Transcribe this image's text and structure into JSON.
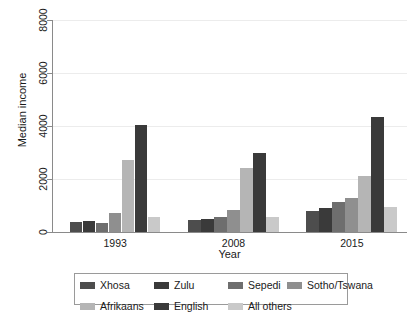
{
  "chart_data": {
    "type": "bar",
    "title": "",
    "xlabel": "Year",
    "ylabel": "Median income",
    "categories": [
      "1993",
      "2008",
      "2015"
    ],
    "ylim": [
      0,
      8000
    ],
    "yticks": [
      0,
      2000,
      4000,
      6000,
      8000
    ],
    "ytick_labels": [
      "0",
      "2000",
      "4000",
      "6000",
      "8000"
    ],
    "grid": "horizontal",
    "legend_position": "bottom",
    "series": [
      {
        "name": "Xhosa",
        "color": "#4d4d4d",
        "values": [
          380,
          470,
          800
        ]
      },
      {
        "name": "Zulu",
        "color": "#3a3a3a",
        "values": [
          420,
          500,
          900
        ]
      },
      {
        "name": "Sepedi",
        "color": "#6e6e6e",
        "values": [
          340,
          560,
          1150
        ]
      },
      {
        "name": "Sotho/Tswana",
        "color": "#8f8f8f",
        "values": [
          700,
          830,
          1300
        ]
      },
      {
        "name": "Afrikaans",
        "color": "#b5b5b5",
        "values": [
          2700,
          2430,
          2120
        ]
      },
      {
        "name": "English",
        "color": "#3a3a3a",
        "values": [
          4050,
          3000,
          4330
        ]
      },
      {
        "name": "All others",
        "color": "#c9c9c9",
        "values": [
          580,
          570,
          940
        ]
      }
    ]
  }
}
